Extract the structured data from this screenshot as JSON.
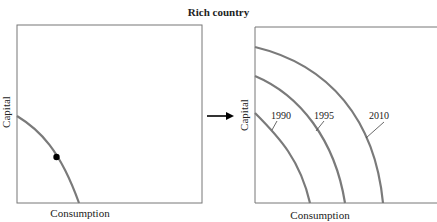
{
  "title": "Rich country",
  "colors": {
    "frame": "#777777",
    "curve": "#7a7a7a",
    "point": "#000000",
    "arrow": "#000000",
    "text": "#222222"
  },
  "left_panel": {
    "xlabel": "Consumption",
    "ylabel": "Capital",
    "curve": {
      "label": ""
    },
    "point": {
      "label": ""
    }
  },
  "right_panel": {
    "xlabel": "Consumption",
    "ylabel": "Capital",
    "curves": [
      {
        "label": "1990"
      },
      {
        "label": "1995"
      },
      {
        "label": "2010"
      }
    ]
  },
  "arrow": {
    "direction": "right"
  }
}
